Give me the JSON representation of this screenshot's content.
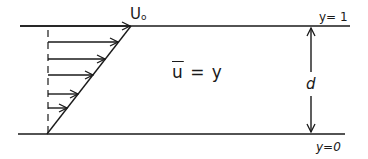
{
  "diagram": {
    "labels": {
      "velocity": "U",
      "velocity_sub": "o",
      "equation_u": "u",
      "equation_rest": " = y",
      "gap": "d",
      "top_boundary": "y= 1",
      "bottom_boundary": "y=0"
    },
    "colors": {
      "stroke": "#1a1a1a",
      "background": "#ffffff"
    },
    "geometry": {
      "top_wall_y": 26,
      "bottom_wall_y": 134,
      "profile_start": [
        47,
        134
      ],
      "profile_end": [
        131,
        26
      ],
      "arrow_rows_y": [
        26,
        42,
        59,
        75,
        94,
        108
      ]
    }
  }
}
